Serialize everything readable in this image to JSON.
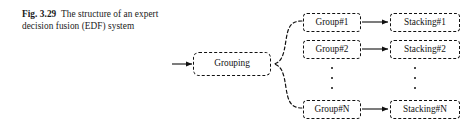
{
  "caption": {
    "figure_label": "Fig. 3.29",
    "text": "The structure of an expert decision fusion (EDF) system"
  },
  "diagram": {
    "type": "block-flow-diagram",
    "input_arrow": "input-arrow",
    "grouping_node": {
      "label": "Grouping",
      "style": "dashed-rounded-box"
    },
    "branch_connector": "dashed-curly-brace",
    "rows": [
      {
        "group_label": "Group#1",
        "stacking_label": "Stacking#1"
      },
      {
        "group_label": "Group#2",
        "stacking_label": "Stacking#2"
      },
      {
        "group_label": "Group#N",
        "stacking_label": "Stacking#N"
      }
    ],
    "ellipsis_group": "vertical-ellipsis",
    "ellipsis_stacking": "vertical-ellipsis",
    "colors": {
      "stroke": "#111111",
      "background": "#ffffff",
      "text": "#111111"
    }
  }
}
